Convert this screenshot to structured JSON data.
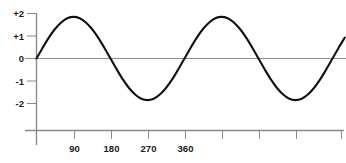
{
  "chart_data": {
    "type": "line",
    "title": "",
    "subtitle": "",
    "xlabel": "",
    "ylabel": "",
    "function": "y = 1.85 * sin(x)",
    "amplitude": 1.85,
    "period_degrees": 360,
    "phase_degrees": 0,
    "grid": false,
    "legend": null,
    "xlim": [
      0,
      760
    ],
    "ylim": [
      -2.35,
      2.2
    ],
    "x_axis": {
      "ticks": [
        90,
        180,
        270,
        360,
        450,
        540,
        630,
        720
      ],
      "tick_labels": [
        "90",
        "180",
        "270",
        "360",
        "",
        "",
        "",
        ""
      ],
      "labeled_ticks": [
        "90",
        "180",
        "270",
        "360"
      ],
      "unlabeled_tick_count": 4,
      "axis_start": -60,
      "axis_end": 755
    },
    "y_axis": {
      "ticks": [
        2,
        1,
        0,
        -1,
        -2
      ],
      "tick_labels": [
        "+2",
        "+1",
        "0",
        "-1",
        "-2"
      ]
    },
    "series": [
      {
        "name": "sine-wave",
        "color": "#111111",
        "linewidth": 2.1,
        "x": [
          0,
          15,
          30,
          45,
          60,
          75,
          90,
          105,
          120,
          135,
          150,
          165,
          180,
          195,
          210,
          225,
          240,
          255,
          270,
          285,
          300,
          315,
          330,
          345,
          360,
          375,
          390,
          405,
          420,
          435,
          450,
          465,
          480,
          495,
          510,
          525,
          540,
          555,
          570,
          585,
          600,
          615,
          630,
          645,
          660,
          675,
          690,
          705,
          720,
          735,
          750
        ],
        "y": [
          0,
          0.48,
          0.93,
          1.31,
          1.6,
          1.79,
          1.85,
          1.79,
          1.6,
          1.31,
          0.93,
          0.48,
          0,
          -0.48,
          -0.93,
          -1.31,
          -1.6,
          -1.79,
          -1.85,
          -1.79,
          -1.6,
          -1.31,
          -0.93,
          -0.48,
          0,
          0.48,
          0.93,
          1.31,
          1.6,
          1.79,
          1.85,
          1.79,
          1.6,
          1.31,
          0.93,
          0.48,
          0,
          -0.48,
          -0.93,
          -1.31,
          -1.6,
          -1.79,
          -1.85,
          -1.79,
          -1.6,
          -1.31,
          -0.93,
          -0.48,
          0,
          0.48,
          0.93
        ]
      }
    ],
    "colors": {
      "curve": "#111111",
      "axis": "#8a8a8a",
      "tick_text": "#1a1a1a",
      "background": "#ffffff"
    }
  }
}
